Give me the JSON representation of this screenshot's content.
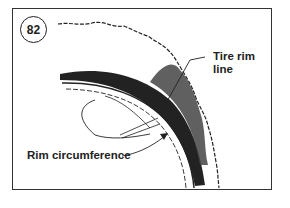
{
  "figure": {
    "number": "82",
    "labels": {
      "tire_rim_line_1": "Tire rim",
      "tire_rim_line_2": "line",
      "rim_circumference": "Rim circumference"
    },
    "colors": {
      "ink": "#222222",
      "background": "#ffffff"
    }
  }
}
